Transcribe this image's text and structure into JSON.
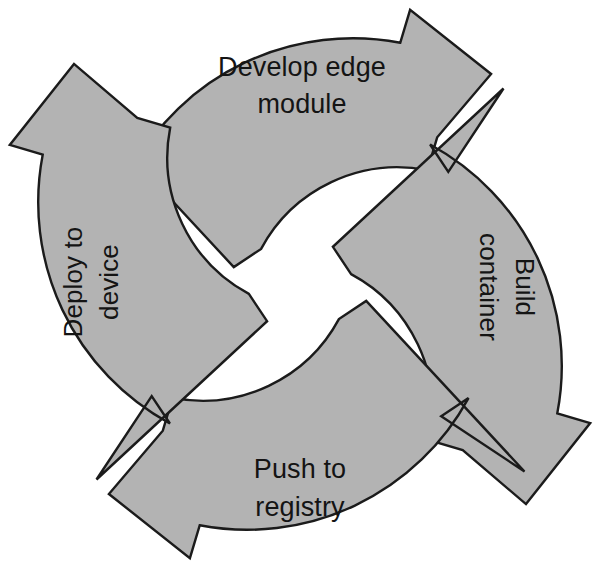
{
  "diagram": {
    "type": "cycle",
    "direction": "clockwise",
    "geometry": {
      "center_x": 300,
      "center_y": 284,
      "outer_radius": 252,
      "inner_radius": 155
    },
    "style": {
      "fill": "#b3b3b3",
      "stroke": "#1b1b1b",
      "text_color": "#141414",
      "background": "#ffffff"
    },
    "segments": [
      {
        "id": "develop-edge-module",
        "position": "top",
        "label": "Develop edge module",
        "label_lines": [
          "Develop edge",
          "module"
        ],
        "orientation": "horizontal",
        "order": 1
      },
      {
        "id": "build-container",
        "position": "right",
        "label": "Build container",
        "label_lines": [
          "Build",
          "container"
        ],
        "orientation": "rotated-clockwise",
        "order": 2
      },
      {
        "id": "push-to-registry",
        "position": "bottom",
        "label": "Push to registry",
        "label_lines": [
          "Push to",
          "registry"
        ],
        "orientation": "horizontal",
        "order": 3
      },
      {
        "id": "deploy-to-device",
        "position": "left",
        "label": "Deploy to device",
        "label_lines": [
          "Deploy to",
          "device"
        ],
        "orientation": "rotated-counterclockwise",
        "order": 4
      }
    ]
  }
}
